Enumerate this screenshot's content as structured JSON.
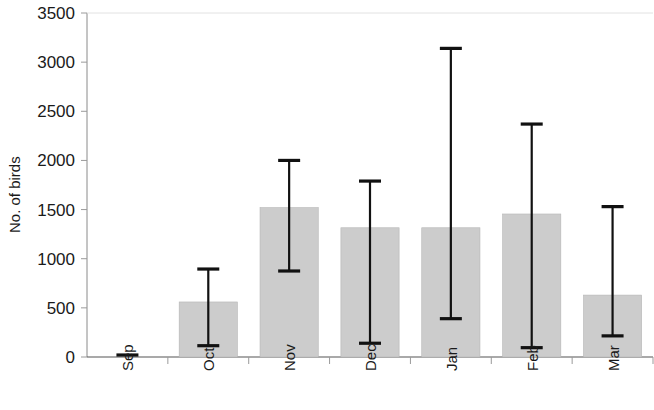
{
  "chart_data": {
    "type": "bar",
    "title": "",
    "subtitle": "",
    "xlabel": "",
    "ylabel": "No. of birds",
    "categories": [
      "Sep",
      "Oct",
      "Nov",
      "Dec",
      "Jan",
      "Feb",
      "Mar"
    ],
    "values": [
      10,
      560,
      1520,
      1315,
      1315,
      1455,
      630
    ],
    "series": [
      {
        "name": "Mean no. of birds",
        "values": [
          10,
          560,
          1520,
          1315,
          1315,
          1455,
          630
        ],
        "error_low": [
          0,
          115,
          875,
          140,
          390,
          95,
          215
        ],
        "error_high": [
          15,
          895,
          2000,
          1790,
          3140,
          2370,
          1530
        ]
      }
    ],
    "ylim": [
      0,
      3500
    ],
    "ytick_values": [
      0,
      500,
      1000,
      1500,
      2000,
      2500,
      3000,
      3500
    ],
    "ytick_labels": [
      "0",
      "500",
      "1000",
      "1500",
      "2000",
      "2500",
      "3000",
      "3500"
    ],
    "grid": false,
    "legend": false,
    "legend_position": "none",
    "bar_color": "#cccccc",
    "bar_edge_color": "#b6b6b6",
    "error_bar_color": "#111111",
    "axis_color": "#8a8a8a",
    "text_color": "#1a1a1a",
    "background_color": "#ffffff",
    "category_label_rotation": -90,
    "annotations": []
  }
}
